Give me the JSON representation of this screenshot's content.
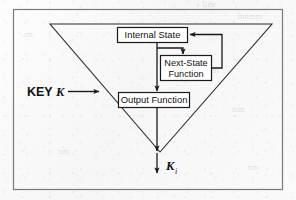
{
  "figure": {
    "background_color": "#fbfbfb",
    "ink_color": "#1a1a1a",
    "frame_color": "#6b6b6b",
    "frame": {
      "x": 13,
      "y": 9,
      "width": 270,
      "height": 181
    }
  },
  "labels": {
    "key_input_prefix": "KEY",
    "key_input_symbol": "K",
    "output_symbol": "K",
    "output_subscript": "i"
  },
  "blocks": [
    {
      "id": "internal-state",
      "label": "Internal State",
      "x": 117,
      "y": 27,
      "width": 71,
      "height": 16
    },
    {
      "id": "next-state-function",
      "label_line1": "Next-State",
      "label_line2": "Function",
      "x": 160,
      "y": 55,
      "width": 52,
      "height": 26
    },
    {
      "id": "output-function",
      "label": "Output Function",
      "x": 118,
      "y": 92,
      "width": 72,
      "height": 16
    }
  ],
  "triangle": {
    "description": "Inverted triangle enclosing the generator",
    "top_left_x": 50,
    "top_right_x": 272,
    "top_y": 24,
    "apex_x": 160,
    "apex_y": 152
  },
  "connections": [
    {
      "id": "key-arrow",
      "from": "KEY K",
      "to": "triangle left edge"
    },
    {
      "id": "state-to-output",
      "from": "Internal State",
      "to": "Output Function"
    },
    {
      "id": "state-to-next-state",
      "from": "Internal State",
      "to": "Next-State Function"
    },
    {
      "id": "next-state-feedback",
      "from": "Next-State Function",
      "to": "Internal State"
    },
    {
      "id": "output-to-keystream",
      "from": "Output Function",
      "to": "K i"
    }
  ],
  "background_marks": [
    {
      "text": "a line",
      "x": 196,
      "y": 2
    },
    {
      "text": "mnmm",
      "x": 238,
      "y": 14
    },
    {
      "text": "mm",
      "x": 206,
      "y": 69
    },
    {
      "text": "nm",
      "x": 58,
      "y": 150
    },
    {
      "text": "mm",
      "x": 232,
      "y": 108
    },
    {
      "text": "nm",
      "x": 248,
      "y": 166
    },
    {
      "text": "im",
      "x": 24,
      "y": 33
    }
  ]
}
